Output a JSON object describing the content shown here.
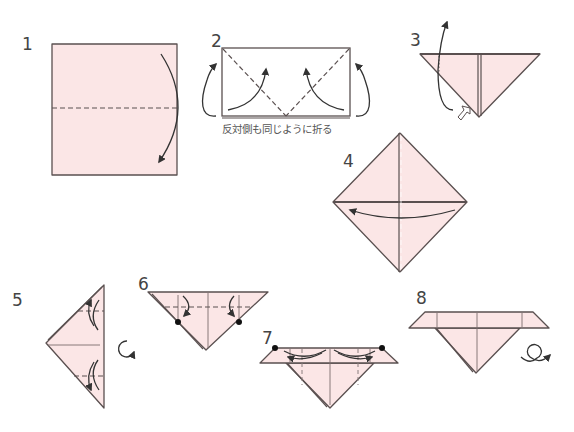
{
  "diagram": {
    "paper_color": "#fbe6e6",
    "line_color": "#5a5050",
    "steps": [
      {
        "number": "1",
        "description": "Valley fold square in half downward"
      },
      {
        "number": "2",
        "description": "Fold bottom corners up along diagonals; repeat on opposite side",
        "caption": "反対側も同じように折る"
      },
      {
        "number": "3",
        "description": "Open pocket and squash-fold"
      },
      {
        "number": "4",
        "description": "Fold right flap over to the left"
      },
      {
        "number": "5",
        "description": "Fold top and bottom points along dashed lines, then turn over"
      },
      {
        "number": "6",
        "description": "Fold top corners down to the dots"
      },
      {
        "number": "7",
        "description": "Fold edges inward along dashed lines"
      },
      {
        "number": "8",
        "description": "Turn over to finish"
      }
    ]
  },
  "icons": {
    "turn_over_5": "rotate-over-icon",
    "turn_over_8": "flip-over-icon"
  }
}
